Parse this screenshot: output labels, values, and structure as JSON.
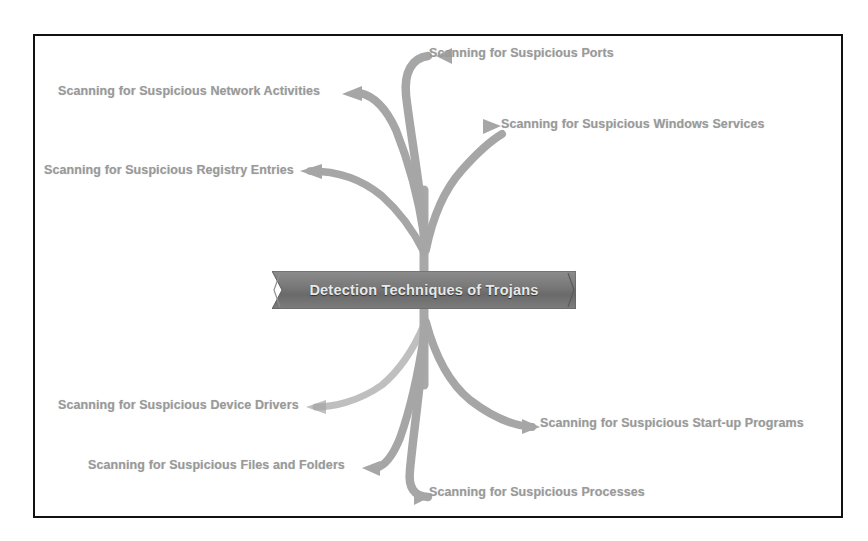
{
  "diagram": {
    "title": "Detection Techniques of Trojans",
    "type": "mind-map",
    "center": {
      "label": "Detection Techniques of Trojans",
      "shape": "ribbon-banner",
      "fill_color": "#6f6f6f",
      "text_color": "#e8e8e8"
    },
    "frame": {
      "border_color": "#111111",
      "background_color": "#ffffff"
    },
    "branch_color": "#a6a6a6",
    "label_color": "#9a9a9a",
    "branches": [
      {
        "id": "network-activities",
        "label": "Scanning for Suspicious Network Activities",
        "side": "upper-left",
        "arrow_direction": "left"
      },
      {
        "id": "ports",
        "label": "Scanning for Suspicious Ports",
        "side": "upper-right",
        "arrow_direction": "right"
      },
      {
        "id": "windows-services",
        "label": "Scanning for Suspicious Windows Services",
        "side": "upper-right",
        "arrow_direction": "right"
      },
      {
        "id": "registry-entries",
        "label": "Scanning for Suspicious Registry Entries",
        "side": "upper-left",
        "arrow_direction": "left"
      },
      {
        "id": "device-drivers",
        "label": "Scanning for Suspicious Device Drivers",
        "side": "lower-left",
        "arrow_direction": "left"
      },
      {
        "id": "start-up-programs",
        "label": "Scanning for Suspicious Start-up Programs",
        "side": "lower-right",
        "arrow_direction": "right"
      },
      {
        "id": "files-and-folders",
        "label": "Scanning for Suspicious Files and Folders",
        "side": "lower-left",
        "arrow_direction": "left"
      },
      {
        "id": "processes",
        "label": "Scanning for Suspicious Processes",
        "side": "lower-right",
        "arrow_direction": "right"
      }
    ]
  }
}
